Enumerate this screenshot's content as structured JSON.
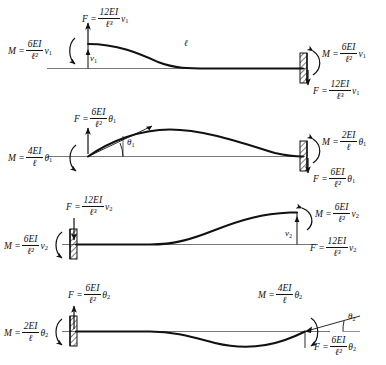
{
  "figure": {
    "type": "engineering-diagram",
    "ink_color": "#111111",
    "beam_color": "#111111",
    "rows": [
      {
        "id": "row-1",
        "case": "unit transverse displacement v1 at left end",
        "dof_symbol": "v",
        "dof_sub": "1",
        "support_left": "free-translating end (roller/guided)",
        "support_right": "fixed (hatched wall)",
        "length_label": "ℓ",
        "labels": {
          "left_moment": {
            "M": "M =",
            "num": "6EI",
            "den": "ℓ²",
            "tail": "v",
            "tail_sub": "1"
          },
          "left_force": {
            "F": "F =",
            "num": "12EI",
            "den": "ℓ³",
            "tail": "v",
            "tail_sub": "1"
          },
          "right_moment": {
            "M": "M =",
            "num": "6EI",
            "den": "ℓ²",
            "tail": "v",
            "tail_sub": "1"
          },
          "right_force": {
            "F": "F =",
            "num": "12EI",
            "den": "ℓ³",
            "tail": "v",
            "tail_sub": "1"
          },
          "displacement": {
            "sym": "v",
            "sub": "1"
          }
        }
      },
      {
        "id": "row-2",
        "case": "unit rotation theta1 at left end",
        "dof_symbol": "θ",
        "dof_sub": "1",
        "support_left": "pinned-rotating end",
        "support_right": "fixed (hatched wall)",
        "length_label": "",
        "labels": {
          "left_moment": {
            "M": "M =",
            "num": "4EI",
            "den": "ℓ",
            "tail": "θ",
            "tail_sub": "1"
          },
          "left_force": {
            "F": "F =",
            "num": "6EI",
            "den": "ℓ²",
            "tail": "θ",
            "tail_sub": "1"
          },
          "right_moment": {
            "M": "M =",
            "num": "2EI",
            "den": "ℓ",
            "tail": "θ",
            "tail_sub": "1"
          },
          "right_force": {
            "F": "F =",
            "num": "6EI",
            "den": "ℓ²",
            "tail": "θ",
            "tail_sub": "1"
          },
          "rotation": {
            "sym": "θ",
            "sub": "1"
          }
        }
      },
      {
        "id": "row-3",
        "case": "unit transverse displacement v2 at right end",
        "dof_symbol": "v",
        "dof_sub": "2",
        "support_left": "fixed (hatched wall)",
        "support_right": "free-translating end",
        "length_label": "",
        "labels": {
          "left_moment": {
            "M": "M =",
            "num": "6EI",
            "den": "ℓ²",
            "tail": "v",
            "tail_sub": "2"
          },
          "left_force": {
            "F": "F =",
            "num": "12EI",
            "den": "ℓ³",
            "tail": "v",
            "tail_sub": "2"
          },
          "right_moment": {
            "M": "M =",
            "num": "6EI",
            "den": "ℓ²",
            "tail": "v",
            "tail_sub": "2"
          },
          "right_force": {
            "F": "F =",
            "num": "12EI",
            "den": "ℓ³",
            "tail": "v",
            "tail_sub": "2"
          },
          "displacement": {
            "sym": "v",
            "sub": "2"
          }
        }
      },
      {
        "id": "row-4",
        "case": "unit rotation theta2 at right end",
        "dof_symbol": "θ",
        "dof_sub": "2",
        "support_left": "fixed (hatched wall)",
        "support_right": "pinned-rotating end",
        "length_label": "",
        "labels": {
          "left_moment": {
            "M": "M =",
            "num": "2EI",
            "den": "ℓ",
            "tail": "θ",
            "tail_sub": "2"
          },
          "left_force": {
            "F": "F =",
            "num": "6EI",
            "den": "ℓ²",
            "tail": "θ",
            "tail_sub": "2"
          },
          "right_moment": {
            "M": "M =",
            "num": "4EI",
            "den": "ℓ",
            "tail": "θ",
            "tail_sub": "2"
          },
          "right_force": {
            "F": "F =",
            "num": "6EI",
            "den": "ℓ²",
            "tail": "θ",
            "tail_sub": "2"
          },
          "rotation": {
            "sym": "θ",
            "sub": "2"
          }
        }
      }
    ]
  }
}
